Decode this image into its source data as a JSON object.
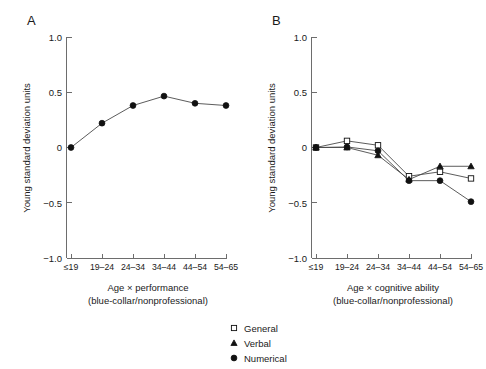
{
  "figure": {
    "background": "#ffffff",
    "marker_color": "#111111",
    "line_color": "#4a4a4a",
    "axis_color": "#6d6d6d"
  },
  "legend": {
    "position": "bottom-center",
    "entries": [
      {
        "label": "General",
        "marker": "open-square"
      },
      {
        "label": "Verbal",
        "marker": "filled-triangle"
      },
      {
        "label": "Numerical",
        "marker": "filled-circle"
      }
    ]
  },
  "chart_data": [
    {
      "panel": "A",
      "type": "line",
      "title": "",
      "xlabel": "Age × performance",
      "xlabel_line2": "(blue-collar/nonprofessional)",
      "ylabel": "Young standard deviation units",
      "categories": [
        "≤19",
        "19–24",
        "24–34",
        "34–44",
        "44–54",
        "54–65"
      ],
      "ylim": [
        -1.0,
        1.0
      ],
      "yticks": [
        1.0,
        0.5,
        0,
        -0.5,
        -1.0
      ],
      "ytick_labels": [
        "1.0",
        "0.5",
        "0",
        "−0.5",
        "−1.0"
      ],
      "grid": false,
      "series": [
        {
          "name": "Performance",
          "marker": "filled-circle",
          "values": [
            0.0,
            0.22,
            0.38,
            0.465,
            0.4,
            0.38
          ]
        }
      ]
    },
    {
      "panel": "B",
      "type": "line",
      "title": "",
      "xlabel": "Age × cognitive ability",
      "xlabel_line2": "(blue-collar/nonprofessional)",
      "ylabel": "Young standard deviation units",
      "categories": [
        "≤19",
        "19–24",
        "24–34",
        "34–44",
        "44–54",
        "54–65"
      ],
      "ylim": [
        -1.0,
        1.0
      ],
      "yticks": [
        1.0,
        0.5,
        0,
        -0.5,
        -1.0
      ],
      "ytick_labels": [
        "1.0",
        "0.5",
        "0",
        "−0.5",
        "−1.0"
      ],
      "grid": false,
      "series": [
        {
          "name": "General",
          "marker": "open-square",
          "values": [
            0.0,
            0.06,
            0.02,
            -0.26,
            -0.22,
            -0.28
          ]
        },
        {
          "name": "Verbal",
          "marker": "filled-triangle",
          "values": [
            0.0,
            0.0,
            -0.07,
            -0.29,
            -0.17,
            -0.17
          ]
        },
        {
          "name": "Numerical",
          "marker": "filled-circle",
          "values": [
            0.0,
            0.005,
            -0.03,
            -0.3,
            -0.3,
            -0.49
          ]
        }
      ]
    }
  ]
}
